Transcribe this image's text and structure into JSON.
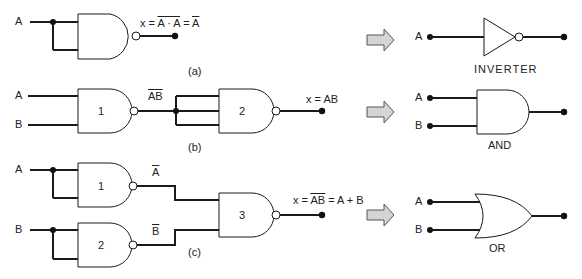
{
  "panels": {
    "a": {
      "caption": "(a)",
      "input": "A",
      "expr_prefix": "x = ",
      "expr_over": "A · A",
      "expr_mid": " = ",
      "expr_result_over": "A",
      "equivalent": "INVERTER",
      "eq_input": "A"
    },
    "b": {
      "caption": "(b)",
      "input_a": "A",
      "input_b": "B",
      "gate1": "1",
      "gate2": "2",
      "intermediate_over": "AB",
      "expr": "x = AB",
      "equivalent": "AND",
      "eq_input_a": "A",
      "eq_input_b": "B"
    },
    "c": {
      "caption": "(c)",
      "input_a": "A",
      "input_b": "B",
      "gate1": "1",
      "gate2": "2",
      "gate3": "3",
      "not_a": "A",
      "not_b": "B",
      "expr_prefix": "x = ",
      "expr_over_a": "A",
      "expr_over_b": "B",
      "expr_suffix": " = A + B",
      "equivalent": "OR",
      "eq_input_a": "A",
      "eq_input_b": "B"
    }
  },
  "colors": {
    "line": "#1a1a1a",
    "arrow_fill": "#d4d4d4"
  }
}
